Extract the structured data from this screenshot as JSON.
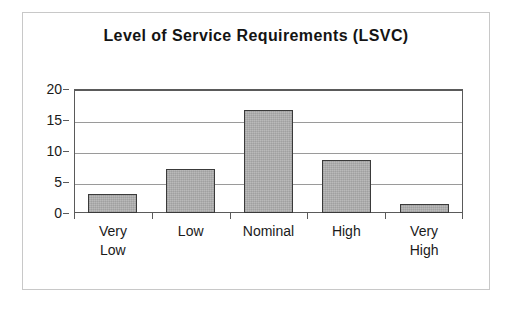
{
  "chart_data": {
    "type": "bar",
    "title": "Level of Service Requirements (LSVC)",
    "categories": [
      "Very\nLow",
      "Low",
      "Nominal",
      "High",
      "Very\nHigh"
    ],
    "values": [
      3.0,
      7.1,
      16.6,
      8.6,
      1.5
    ],
    "xlabel": "",
    "ylabel": "",
    "ylim": [
      0,
      20
    ],
    "yticks": [
      0,
      5,
      10,
      15,
      20
    ],
    "ytick_labels": [
      "0",
      "5",
      "10",
      "15",
      "20"
    ],
    "grid": true,
    "legend": false,
    "bar_color": "#b2b2b2",
    "bar_border_color": "#3a3a3a",
    "axis_color": "#5a5a5a",
    "gridline_color": "#9a9a9a",
    "title_color": "#141414",
    "background_color": "#ffffff",
    "frame_border_color": "#c8c8c8"
  }
}
